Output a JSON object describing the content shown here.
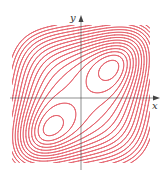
{
  "chart_data": {
    "type": "contour",
    "title": "",
    "xlabel": "x",
    "ylabel": "y",
    "x_ticks": [],
    "y_ticks": [],
    "grid": false,
    "legend": null,
    "extrema": [
      {
        "kind": "local_min",
        "quadrant": "I",
        "position": "upper-right"
      },
      {
        "kind": "local_min",
        "quadrant": "III",
        "position": "lower-left"
      }
    ],
    "saddle": {
      "position": "origin"
    },
    "contour_count_approx": 16,
    "contour_color": "#e0424f",
    "axis_color": "#444444"
  },
  "axes": {
    "x_label": "x",
    "y_label": "y"
  }
}
